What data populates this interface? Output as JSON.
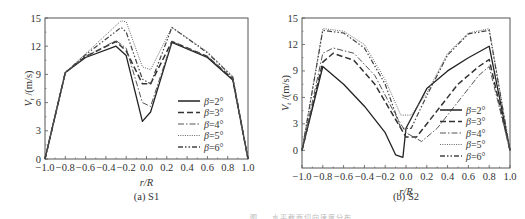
{
  "figure": {
    "caption_partial": "图 … 水平截面切向速度分布",
    "panels": [
      {
        "id": "a",
        "subcaption": "(a) S1"
      },
      {
        "id": "b",
        "subcaption": "(b) S2"
      }
    ]
  },
  "chart_data": [
    {
      "type": "line",
      "title": "(a) S1",
      "xlabel": "r/R",
      "ylabel": "V_t /(m/s)",
      "xlim": [
        -1.0,
        1.0
      ],
      "ylim": [
        0,
        15
      ],
      "xticks": [
        -1.0,
        -0.8,
        -0.6,
        -0.4,
        -0.2,
        0.0,
        0.2,
        0.4,
        0.6,
        0.8,
        1.0
      ],
      "xtick_labels": [
        "-1.0",
        "-0.8",
        "-0.6",
        "-0.4",
        "-0.2",
        "0.0",
        "0.2",
        "0.4",
        "0.6",
        "0.8",
        "1.0"
      ],
      "yticks": [
        0,
        3,
        6,
        9,
        12,
        15
      ],
      "grid": false,
      "legend_position": "lower right",
      "series": [
        {
          "name": "β=2°",
          "style": "solid",
          "x": [
            -1.0,
            -0.8,
            -0.6,
            -0.3,
            -0.2,
            -0.04,
            0.04,
            0.25,
            0.6,
            0.85,
            1.0
          ],
          "y": [
            0,
            9.2,
            10.8,
            12.0,
            11.0,
            4.0,
            5.0,
            12.4,
            10.8,
            8.4,
            0
          ]
        },
        {
          "name": "β=3°",
          "style": "dashed",
          "x": [
            -1.0,
            -0.8,
            -0.6,
            -0.3,
            -0.2,
            -0.04,
            0.04,
            0.25,
            0.6,
            0.85,
            1.0
          ],
          "y": [
            0,
            9.2,
            10.9,
            12.5,
            11.5,
            8.0,
            8.0,
            12.5,
            10.9,
            8.5,
            0
          ]
        },
        {
          "name": "β=4°",
          "style": "dash-dot",
          "x": [
            -1.0,
            -0.8,
            -0.6,
            -0.3,
            -0.2,
            -0.04,
            0.04,
            0.25,
            0.6,
            0.85,
            1.0
          ],
          "y": [
            0,
            9.2,
            10.9,
            12.6,
            11.8,
            6.0,
            5.6,
            12.5,
            10.9,
            8.6,
            0
          ]
        },
        {
          "name": "β=5°",
          "style": "dotted",
          "x": [
            -1.0,
            -0.8,
            -0.6,
            -0.25,
            -0.2,
            -0.04,
            0.04,
            0.25,
            0.6,
            0.85,
            1.0
          ],
          "y": [
            0,
            9.2,
            11.2,
            14.7,
            14.6,
            9.8,
            9.5,
            14.0,
            11.4,
            8.8,
            0
          ]
        },
        {
          "name": "β=6°",
          "style": "dash-dot-dot",
          "x": [
            -1.0,
            -0.8,
            -0.6,
            -0.25,
            -0.2,
            -0.04,
            0.04,
            0.25,
            0.6,
            0.85,
            1.0
          ],
          "y": [
            0,
            9.2,
            11.1,
            14.0,
            13.5,
            8.5,
            8.0,
            14.0,
            11.3,
            8.7,
            0
          ]
        }
      ]
    },
    {
      "type": "line",
      "title": "(b) S2",
      "xlabel": "r/R",
      "ylabel": "V_t /(m/s)",
      "xlim": [
        -1.0,
        1.0
      ],
      "ylim": [
        -2,
        15
      ],
      "xticks": [
        -1.0,
        -0.8,
        -0.6,
        -0.4,
        -0.2,
        0.0,
        0.2,
        0.4,
        0.6,
        0.8,
        1.0
      ],
      "xtick_labels": [
        "-1.0",
        "-0.8",
        "-0.6",
        "-0.4",
        "-0.2",
        "0.0",
        "0.2",
        "0.4",
        "0.6",
        "0.8",
        "1.0"
      ],
      "yticks": [
        0,
        3,
        6,
        9,
        12,
        15
      ],
      "grid": false,
      "legend_position": "lower right",
      "series": [
        {
          "name": "β=2°",
          "style": "solid",
          "x": [
            -1.0,
            -0.8,
            -0.6,
            -0.4,
            -0.2,
            -0.1,
            -0.03,
            0.0,
            0.2,
            0.4,
            0.6,
            0.8,
            1.0
          ],
          "y": [
            0,
            9.5,
            7.5,
            5.0,
            2.0,
            -0.5,
            -0.8,
            2.5,
            7.0,
            9.0,
            10.5,
            11.8,
            0
          ]
        },
        {
          "name": "β=3°",
          "style": "dashed",
          "x": [
            -1.0,
            -0.8,
            -0.7,
            -0.5,
            -0.3,
            -0.1,
            0.0,
            0.1,
            0.3,
            0.5,
            0.7,
            0.8,
            1.0
          ],
          "y": [
            0,
            10.0,
            11.0,
            10.2,
            7.5,
            3.5,
            1.5,
            1.5,
            4.5,
            7.5,
            9.5,
            10.3,
            0
          ]
        },
        {
          "name": "β=4°",
          "style": "dash-dot",
          "x": [
            -1.0,
            -0.8,
            -0.7,
            -0.5,
            -0.3,
            -0.1,
            0.0,
            0.15,
            0.3,
            0.5,
            0.7,
            0.8,
            1.0
          ],
          "y": [
            0,
            11.0,
            11.6,
            11.0,
            8.5,
            4.0,
            2.0,
            1.0,
            2.5,
            5.5,
            8.5,
            9.5,
            0
          ]
        },
        {
          "name": "β=5°",
          "style": "dotted",
          "x": [
            -1.0,
            -0.8,
            -0.6,
            -0.4,
            -0.2,
            -0.05,
            0.05,
            0.2,
            0.4,
            0.6,
            0.8,
            1.0
          ],
          "y": [
            0,
            13.8,
            13.5,
            12.0,
            8.0,
            4.0,
            4.0,
            6.5,
            11.0,
            13.3,
            13.8,
            0
          ]
        },
        {
          "name": "β=6°",
          "style": "dash-dot-dot",
          "x": [
            -1.0,
            -0.8,
            -0.6,
            -0.4,
            -0.2,
            -0.05,
            0.05,
            0.2,
            0.4,
            0.6,
            0.8,
            1.0
          ],
          "y": [
            0,
            13.6,
            13.3,
            11.6,
            7.5,
            2.5,
            2.5,
            6.2,
            10.8,
            13.2,
            13.6,
            0
          ]
        }
      ]
    }
  ]
}
